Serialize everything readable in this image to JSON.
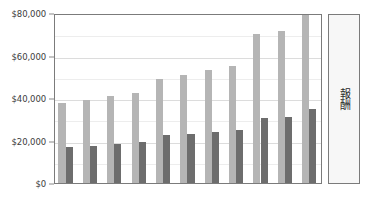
{
  "chart_data": {
    "type": "bar",
    "title": "",
    "subtitle": "",
    "xlabel": "",
    "ylabel": "",
    "ylim": [
      0,
      80000
    ],
    "ytick_values": [
      0,
      20000,
      40000,
      60000,
      80000
    ],
    "ytick_labels": [
      "$0",
      "$20,000",
      "$40,000",
      "$60,000",
      "$80,000"
    ],
    "grid": true,
    "minor_gridlines": true,
    "legend_position": "right",
    "categories": [
      "1",
      "2",
      "3",
      "4",
      "5",
      "6",
      "7",
      "8",
      "9",
      "10",
      "11"
    ],
    "xtick_labels_visible": false,
    "series": [
      {
        "name": "報酬",
        "color": "#b5b5b5",
        "values": [
          37500,
          39000,
          41000,
          42500,
          49000,
          51000,
          53000,
          55000,
          70000,
          71500,
          81000
        ]
      },
      {
        "name": "報酬",
        "color": "#6d6d6d",
        "values": [
          17000,
          17500,
          18500,
          19500,
          22500,
          23000,
          24000,
          25000,
          30500,
          31000,
          35000
        ]
      }
    ]
  },
  "legend": {
    "label": "報酬"
  },
  "colors": {
    "series_light": "#b5b5b5",
    "series_dark": "#6d6d6d",
    "axis": "#7b7b7b",
    "gridline": "#dcdcdc",
    "gridline_minor": "#ededed",
    "text": "#3c3c3c",
    "legend_background": "#f7f7f7",
    "plot_background": "#ffffff"
  }
}
